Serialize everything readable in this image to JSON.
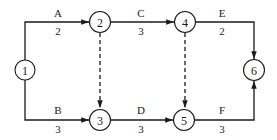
{
  "diagram": {
    "type": "activity-on-arrow network",
    "nodes": [
      {
        "id": "1",
        "label": "1"
      },
      {
        "id": "2",
        "label": "2"
      },
      {
        "id": "3",
        "label": "3"
      },
      {
        "id": "4",
        "label": "4"
      },
      {
        "id": "5",
        "label": "5"
      },
      {
        "id": "6",
        "label": "6"
      }
    ],
    "activities": [
      {
        "name": "A",
        "duration": "2",
        "from": "1",
        "to": "2"
      },
      {
        "name": "B",
        "duration": "3",
        "from": "1",
        "to": "3"
      },
      {
        "name": "C",
        "duration": "3",
        "from": "2",
        "to": "4"
      },
      {
        "name": "D",
        "duration": "3",
        "from": "3",
        "to": "5"
      },
      {
        "name": "E",
        "duration": "2",
        "from": "4",
        "to": "6"
      },
      {
        "name": "F",
        "duration": "3",
        "from": "5",
        "to": "6"
      }
    ],
    "dummy_activities": [
      {
        "from": "2",
        "to": "3"
      },
      {
        "from": "4",
        "to": "5"
      }
    ]
  }
}
